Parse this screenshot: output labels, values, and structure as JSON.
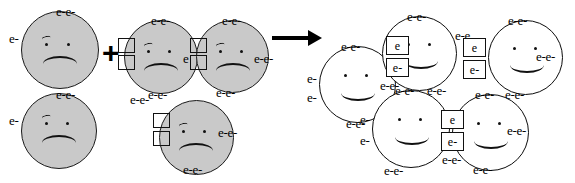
{
  "diagram": {
    "operator_plus": "+",
    "operator_arrow": "arrow-right",
    "electron_label": "e-",
    "electron_label_bare": "e",
    "colors": {
      "reactant_fill": "#c9c9c9",
      "product_fill": "#ffffff",
      "outline": "#1a1a1a",
      "ink": "#000000"
    }
  },
  "reactants": {
    "group_a": {
      "name": "lone-unhappy-pair",
      "atoms": [
        {
          "id": "r1",
          "mood": "sad",
          "fill": "#c9c9c9",
          "electrons": [
            "e-",
            "e-",
            "e-"
          ],
          "orbital_boxes": []
        },
        {
          "id": "r2",
          "mood": "sad",
          "fill": "#c9c9c9",
          "electrons": [
            "e-",
            "e-",
            "e-"
          ],
          "orbital_boxes": []
        }
      ]
    },
    "group_b": {
      "name": "unhappy-cluster-with-empty-orbitals",
      "atoms": [
        {
          "id": "r3",
          "mood": "sad",
          "fill": "#c9c9c9",
          "electrons": [
            "e-",
            "e-",
            "e",
            "e-",
            "e-"
          ],
          "orbital_boxes": [
            "empty",
            "empty"
          ]
        },
        {
          "id": "r4",
          "mood": "sad",
          "fill": "#c9c9c9",
          "electrons": [
            "e-",
            "e-",
            "e-",
            "e-",
            "e-",
            "e-"
          ],
          "orbital_boxes": [
            "empty",
            "empty"
          ]
        },
        {
          "id": "r5",
          "mood": "sad",
          "fill": "#c9c9c9",
          "electrons": [
            "e-",
            "e-",
            "e-",
            "e-",
            "e-"
          ],
          "orbital_boxes": [
            "empty",
            "empty"
          ]
        }
      ]
    }
  },
  "products": {
    "name": "happy-bonded-cluster",
    "atoms": [
      {
        "id": "p1",
        "mood": "happy",
        "fill": "#ffffff",
        "electrons": [
          "e-",
          "e-",
          "e-",
          "e-",
          "e-",
          "e-",
          "e-"
        ],
        "orbital_boxes": []
      },
      {
        "id": "p2",
        "mood": "happy",
        "fill": "#ffffff",
        "electrons": [
          "e-",
          "e-",
          "e-",
          "e-",
          "e-",
          "e-"
        ],
        "orbital_boxes": [
          "e",
          "e-"
        ]
      },
      {
        "id": "p3",
        "mood": "happy",
        "fill": "#ffffff",
        "electrons": [
          "e-",
          "e-",
          "e-",
          "e-",
          "e-",
          "e-"
        ],
        "orbital_boxes": [
          "e",
          "e-"
        ]
      },
      {
        "id": "p4",
        "mood": "happy",
        "fill": "#ffffff",
        "electrons": [
          "e-",
          "e-",
          "e-",
          "e-",
          "e-",
          "e-"
        ],
        "orbital_boxes": []
      },
      {
        "id": "p5",
        "mood": "happy",
        "fill": "#ffffff",
        "electrons": [
          "e-",
          "e-",
          "e-",
          "e-",
          "e-"
        ],
        "orbital_boxes": [
          "e",
          "e-"
        ]
      }
    ]
  },
  "labels": {
    "r1_top": "e-e-",
    "r1_left": "e-",
    "r2_top": "e-e-",
    "r2_left": "e-",
    "r3_top": "e-e-",
    "r3_bottom": "e-e-",
    "r3_right": "e",
    "r4_top": "e-e-",
    "r4_right": "e-e-",
    "r4_bottom": "e-e-",
    "r5_top_left": "e-e-",
    "r5_right": "e-e-",
    "r5_bottom": "e-e-",
    "p1_top": "e-e-",
    "p1_left_up": "e-",
    "p1_left_dn": "e-",
    "p1_bottom": "e-e-",
    "p2_top": "e-e-",
    "p2_right": "e-e",
    "p2_left": "e-e-",
    "p2_bottom": "e-e-",
    "p3_top": "e-e-",
    "p3_right": "e-e-",
    "p3_bottom": "e-e-",
    "p4_top": "e-e-",
    "p4_left_up": "e-",
    "p4_left_dn": "e-",
    "p4_bottom": "e-e-",
    "p4_right": "e-e-",
    "p5_top": "e-e-",
    "p5_right": "e-e-",
    "p5_bottom": "e-e-"
  }
}
